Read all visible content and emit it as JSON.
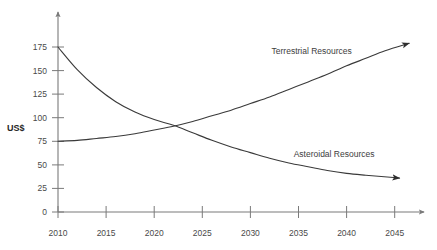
{
  "chart_data": {
    "type": "line",
    "title": "",
    "xlabel": "",
    "ylabel": "US$",
    "xlim": [
      2010,
      2047
    ],
    "ylim": [
      0,
      185
    ],
    "grid": false,
    "legend_position": "inline-annotation",
    "x_ticks": [
      "2010",
      "2015",
      "2020",
      "2025",
      "2030",
      "2035",
      "2040",
      "2045"
    ],
    "y_ticks": [
      "0",
      "25",
      "50",
      "75",
      "100",
      "125",
      "150",
      "175"
    ],
    "x_tick_values": [
      2010,
      2015,
      2020,
      2025,
      2030,
      2035,
      2040,
      2045
    ],
    "y_tick_values": [
      0,
      25,
      50,
      75,
      100,
      125,
      150,
      175
    ],
    "annotations": [
      "Terrestrial Resources",
      "Asteroidal Resources"
    ],
    "crossing_point": {
      "x": 2022.5,
      "y": 92
    },
    "series": [
      {
        "name": "Terrestrial Resources",
        "color": "#3a3a3a",
        "label_x": 2032.2,
        "label_y": 168,
        "x": [
          2010,
          2012,
          2014,
          2016,
          2018,
          2020,
          2022,
          2024,
          2026,
          2028,
          2030,
          2032,
          2034,
          2036,
          2038,
          2040,
          2042,
          2044,
          2046.5
        ],
        "values": [
          75,
          76,
          78,
          80,
          83,
          87,
          91,
          96,
          102,
          108,
          115,
          122,
          130,
          138,
          146,
          155,
          163,
          171,
          179
        ]
      },
      {
        "name": "Asteroidal Resources",
        "color": "#3a3a3a",
        "label_x": 2034.5,
        "label_y": 58,
        "x": [
          2010,
          2012,
          2014,
          2016,
          2018,
          2020,
          2022,
          2024,
          2026,
          2028,
          2030,
          2032,
          2034,
          2036,
          2038,
          2040,
          2042,
          2045.5
        ],
        "values": [
          175,
          151,
          132,
          117,
          106,
          98,
          92,
          84,
          76,
          69,
          63,
          57,
          52,
          48,
          44,
          41,
          39,
          36
        ]
      }
    ]
  },
  "colors": {
    "background": "#ffffff",
    "axis": "#7a7a7a",
    "line": "#3a3a3a",
    "tick_text": "#4a4a4a",
    "axis_title_text": "#262626"
  }
}
